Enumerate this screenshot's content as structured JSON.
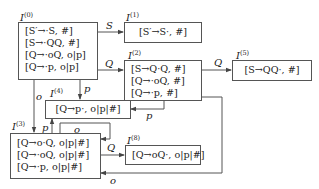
{
  "diagram": {
    "type": "LR(1) item set DFA",
    "states": [
      {
        "id": "I0",
        "label": "I",
        "sup": "(0)",
        "items": [
          "[S′→·S, #]",
          "[S→·QQ, #]",
          "[Q→·oQ, o|p]",
          "[Q→·p, o|p]"
        ]
      },
      {
        "id": "I1",
        "label": "I",
        "sup": "(1)",
        "items": [
          "[S′→S·, #]"
        ]
      },
      {
        "id": "I2",
        "label": "I",
        "sup": "(2)",
        "items": [
          "[S→Q·Q, #]",
          "[Q→·oQ, #]",
          "[Q→·p, #]"
        ]
      },
      {
        "id": "I5",
        "label": "I",
        "sup": "(5)",
        "items": [
          "[S→QQ·, #]"
        ]
      },
      {
        "id": "I4",
        "label": "I",
        "sup": "(4)",
        "items": [
          "[Q→p·, o|p|#]"
        ]
      },
      {
        "id": "I3",
        "label": "I",
        "sup": "(3)",
        "items": [
          "[Q→o·Q, o|p|#]",
          "[Q→·oQ, o|p|#]",
          "[Q→·p, o|p|#]"
        ]
      },
      {
        "id": "I8",
        "label": "I",
        "sup": "(8)",
        "items": [
          "[Q→oQ·, o|p|#]"
        ]
      }
    ],
    "edges": [
      {
        "from": "I0",
        "to": "I1",
        "label": "S"
      },
      {
        "from": "I0",
        "to": "I2",
        "label": "Q"
      },
      {
        "from": "I0",
        "to": "I4",
        "label": "p"
      },
      {
        "from": "I0",
        "to": "I3",
        "label": "o"
      },
      {
        "from": "I2",
        "to": "I5",
        "label": "Q"
      },
      {
        "from": "I2",
        "to": "I4",
        "label": "p"
      },
      {
        "from": "I2",
        "to": "I3",
        "label": "o"
      },
      {
        "from": "I3",
        "to": "I4",
        "label": "p"
      },
      {
        "from": "I3",
        "to": "I3",
        "label": "o"
      },
      {
        "from": "I3",
        "to": "I8",
        "label": "Q"
      }
    ]
  }
}
